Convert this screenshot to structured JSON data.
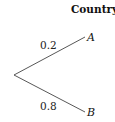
{
  "diagram": {
    "type": "probability-tree",
    "heading": "Country",
    "branches": [
      {
        "label": "A",
        "probability": "0.2"
      },
      {
        "label": "B",
        "probability": "0.8"
      }
    ]
  }
}
